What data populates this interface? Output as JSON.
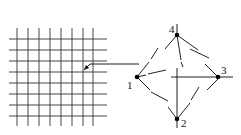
{
  "diagram": {
    "grid": {
      "horizontal_y": [
        39,
        50,
        61,
        72,
        83,
        94,
        105,
        116
      ],
      "vertical_x": [
        17,
        28,
        39,
        50,
        61,
        72,
        83,
        93
      ],
      "x_range": [
        9,
        107
      ],
      "y_range": [
        28,
        126
      ]
    },
    "arrow": {
      "points": [
        [
          139,
          64
        ],
        [
          90,
          64
        ],
        [
          84,
          70
        ]
      ]
    },
    "nodes": [
      {
        "id": "1",
        "label": "1",
        "x": 137,
        "y": 77,
        "label_x": 127,
        "label_y": 89
      },
      {
        "id": "2",
        "label": "2",
        "x": 177,
        "y": 119,
        "label_x": 181,
        "label_y": 127
      },
      {
        "id": "3",
        "label": "3",
        "x": 218,
        "y": 77,
        "label_x": 221,
        "label_y": 74
      },
      {
        "id": "4",
        "label": "4",
        "x": 177,
        "y": 35,
        "label_x": 169,
        "label_y": 33
      }
    ],
    "segments": [
      [
        177,
        24,
        177,
        35
      ],
      [
        177,
        35,
        165,
        49
      ],
      [
        177,
        35,
        198,
        50
      ],
      [
        177,
        35,
        181,
        60
      ],
      [
        181,
        62,
        183,
        67
      ],
      [
        137,
        77,
        149,
        62
      ],
      [
        151,
        59,
        158,
        48
      ],
      [
        137,
        77,
        146,
        75
      ],
      [
        148,
        74,
        166,
        70
      ],
      [
        137,
        77,
        150,
        90
      ],
      [
        151,
        92,
        168,
        101
      ],
      [
        168,
        107,
        177,
        119
      ],
      [
        177,
        68,
        177,
        128
      ],
      [
        171,
        77,
        233,
        77
      ],
      [
        190,
        49,
        209,
        58
      ],
      [
        205,
        64,
        218,
        77
      ],
      [
        218,
        79,
        207,
        90
      ],
      [
        177,
        119,
        190,
        103
      ],
      [
        191,
        100,
        199,
        87
      ]
    ]
  }
}
